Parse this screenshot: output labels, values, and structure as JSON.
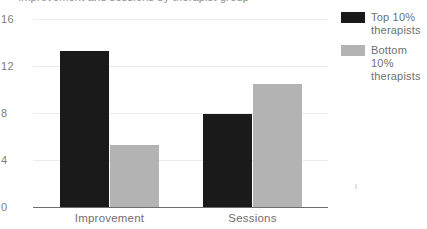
{
  "chart_data": {
    "type": "bar",
    "title": "Improvement and sessions by therapist group",
    "categories": [
      "Improvement",
      "Sessions"
    ],
    "series": [
      {
        "name": "Top 10% therapists",
        "color": "#1a1a1a",
        "values": [
          13.3,
          7.9
        ]
      },
      {
        "name": "Bottom 10% therapists",
        "color": "#b3b3b3",
        "values": [
          5.3,
          10.5
        ]
      }
    ],
    "xlabel": "",
    "ylabel": "",
    "ylim": [
      0,
      16
    ],
    "yticks": [
      16,
      12,
      8,
      4,
      0
    ],
    "grid": true,
    "legend_position": "right"
  },
  "legend": {
    "entries": [
      {
        "label": "Top 10% therapists",
        "swatch": "dark-swatch"
      },
      {
        "label": "Bottom 10% therapists",
        "swatch": "light-swatch"
      }
    ]
  }
}
